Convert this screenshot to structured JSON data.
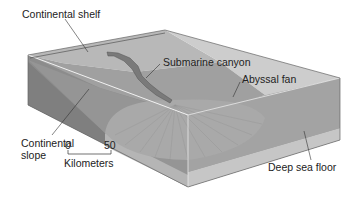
{
  "diagram": {
    "type": "block-diagram",
    "labels": {
      "continental_shelf": "Continental shelf",
      "submarine_canyon": "Submarine canyon",
      "abyssal_fan": "Abyssal fan",
      "continental_slope_line1": "Continental",
      "continental_slope_line2": "slope",
      "deep_sea_floor": "Deep sea floor"
    },
    "scale_bar": {
      "min": "0",
      "max": "50",
      "unit": "Kilometers"
    },
    "colors": {
      "shelf_top": "#b9b9b9",
      "slope_top": "#9a9a9a",
      "fan": "#a5a5a5",
      "floor": "#9e9e9e",
      "front_face": "#8a8a8a",
      "side_face": "#a8a8a8",
      "sediment_layer": "#c4c4c4",
      "canyon": "#7a7a7a",
      "edge_line": "#555555"
    }
  }
}
